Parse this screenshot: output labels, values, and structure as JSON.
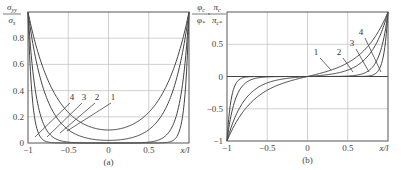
{
  "chart_data": [
    {
      "id": "a",
      "type": "line",
      "panel_label": "(a)",
      "title": "",
      "xlabel": "x/l",
      "ylabel": {
        "num": "σ",
        "num_sub": "yy",
        "den": "σ",
        "den_sub": "s"
      },
      "xlim": [
        -1,
        1
      ],
      "ylim": [
        0,
        1
      ],
      "grid": true,
      "x_ticks": [
        -1,
        -0.5,
        0,
        0.5
      ],
      "x_tick_labels": [
        "−1",
        "−0.5",
        "0",
        "0.5"
      ],
      "y_ticks": [
        0,
        0.2,
        0.4,
        0.6,
        0.8
      ],
      "y_tick_labels": [
        "0",
        "0.2",
        "0.4",
        "0.6",
        "0.8"
      ],
      "curve_labels": [
        "1",
        "2",
        "3",
        "4"
      ],
      "x": [
        -1,
        -0.95,
        -0.9,
        -0.85,
        -0.8,
        -0.7,
        -0.6,
        -0.5,
        -0.4,
        -0.3,
        -0.2,
        -0.1,
        0,
        0.1,
        0.2,
        0.3,
        0.4,
        0.5,
        0.6,
        0.7,
        0.8,
        0.85,
        0.9,
        0.95,
        1
      ],
      "series": [
        {
          "name": "1",
          "values": [
            1.0,
            0.86,
            0.74,
            0.64,
            0.55,
            0.41,
            0.31,
            0.24,
            0.18,
            0.15,
            0.12,
            0.105,
            0.1,
            0.105,
            0.12,
            0.15,
            0.18,
            0.24,
            0.31,
            0.41,
            0.55,
            0.64,
            0.74,
            0.86,
            1.0
          ]
        },
        {
          "name": "2",
          "values": [
            1.0,
            0.79,
            0.63,
            0.5,
            0.4,
            0.25,
            0.16,
            0.1,
            0.065,
            0.043,
            0.03,
            0.022,
            0.02,
            0.022,
            0.03,
            0.043,
            0.065,
            0.1,
            0.16,
            0.25,
            0.4,
            0.5,
            0.63,
            0.79,
            1.0
          ]
        },
        {
          "name": "3",
          "values": [
            1.0,
            0.61,
            0.37,
            0.22,
            0.14,
            0.05,
            0.018,
            0.007,
            0.003,
            0.001,
            0.0,
            0.0,
            0.0,
            0.0,
            0.0,
            0.001,
            0.003,
            0.007,
            0.018,
            0.05,
            0.14,
            0.22,
            0.37,
            0.61,
            1.0
          ]
        },
        {
          "name": "4",
          "values": [
            1.0,
            0.37,
            0.14,
            0.05,
            0.018,
            0.002,
            0.0,
            0.0,
            0.0,
            0.0,
            0.0,
            0.0,
            0.0,
            0.0,
            0.0,
            0.0,
            0.0,
            0.0,
            0.0,
            0.002,
            0.018,
            0.05,
            0.14,
            0.37,
            1.0
          ]
        }
      ],
      "k": [
        3.0,
        4.6,
        10,
        20
      ]
    },
    {
      "id": "b",
      "type": "line",
      "panel_label": "(b)",
      "title": "",
      "xlabel": "x/l",
      "ylabel": {
        "num": "π",
        "num_sub": "c",
        "den": "π",
        "den_sub": "c*"
      },
      "ylabel_left": {
        "num": "φ",
        "num_sub": "c",
        "den": "φ",
        "den_sub": "*"
      },
      "xlim": [
        -1,
        1
      ],
      "ylim": [
        -1,
        1
      ],
      "grid": true,
      "x_ticks": [
        -1,
        -0.5,
        0,
        0.5
      ],
      "x_tick_labels": [
        "−1",
        "−0.5",
        "0",
        "0.5"
      ],
      "y_ticks": [
        -1,
        -0.5,
        0,
        0.5
      ],
      "y_tick_labels": [
        "−1",
        "−0.5",
        "0",
        "0.5"
      ],
      "curve_labels": [
        "1",
        "2",
        "3",
        "4"
      ],
      "x": [
        -1,
        -0.95,
        -0.9,
        -0.85,
        -0.8,
        -0.7,
        -0.6,
        -0.5,
        -0.4,
        -0.3,
        -0.2,
        -0.1,
        0,
        0.1,
        0.2,
        0.3,
        0.4,
        0.5,
        0.6,
        0.7,
        0.8,
        0.85,
        0.9,
        0.95,
        1
      ],
      "series": [
        {
          "name": "1",
          "values": [
            -1.0,
            -0.86,
            -0.73,
            -0.63,
            -0.54,
            -0.4,
            -0.3,
            -0.22,
            -0.16,
            -0.11,
            -0.07,
            -0.03,
            0.0,
            0.03,
            0.07,
            0.11,
            0.16,
            0.22,
            0.3,
            0.4,
            0.54,
            0.63,
            0.73,
            0.86,
            1.0
          ]
        },
        {
          "name": "2",
          "values": [
            -1.0,
            -0.79,
            -0.63,
            -0.5,
            -0.4,
            -0.25,
            -0.16,
            -0.1,
            -0.06,
            -0.04,
            -0.02,
            -0.01,
            0.0,
            0.01,
            0.02,
            0.04,
            0.06,
            0.1,
            0.16,
            0.25,
            0.4,
            0.5,
            0.63,
            0.79,
            1.0
          ]
        },
        {
          "name": "3",
          "values": [
            -1.0,
            -0.61,
            -0.37,
            -0.22,
            -0.14,
            -0.05,
            -0.018,
            -0.007,
            -0.002,
            -0.001,
            0.0,
            0.0,
            0.0,
            0.0,
            0.0,
            0.001,
            0.002,
            0.007,
            0.018,
            0.05,
            0.14,
            0.22,
            0.37,
            0.61,
            1.0
          ]
        },
        {
          "name": "4",
          "values": [
            -1.0,
            -0.37,
            -0.14,
            -0.05,
            -0.018,
            -0.002,
            0.0,
            0.0,
            0.0,
            0.0,
            0.0,
            0.0,
            0.0,
            0.0,
            0.0,
            0.0,
            0.0,
            0.0,
            0.0,
            0.002,
            0.018,
            0.05,
            0.14,
            0.37,
            1.0
          ]
        }
      ],
      "k": [
        3.0,
        4.6,
        10,
        20
      ]
    }
  ],
  "layout": {
    "a": {
      "left": 28,
      "top": 12,
      "right": 189,
      "bottom": 143
    },
    "b": {
      "left": 227,
      "top": 12,
      "right": 388,
      "bottom": 141
    }
  },
  "annotations": {
    "a": [
      {
        "label": "4",
        "tx": 72,
        "ty": 100,
        "lx1": 70,
        "ly1": 103,
        "lx2": 35,
        "ly2": 137
      },
      {
        "label": "3",
        "tx": 84,
        "ty": 100,
        "lx1": 82,
        "ly1": 103,
        "lx2": 47,
        "ly2": 137
      },
      {
        "label": "2",
        "tx": 97,
        "ty": 100,
        "lx1": 95,
        "ly1": 103,
        "lx2": 60,
        "ly2": 133
      },
      {
        "label": "1",
        "tx": 113,
        "ty": 100,
        "lx1": 111,
        "ly1": 103,
        "lx2": 67,
        "ly2": 131
      }
    ],
    "b": [
      {
        "label": "1",
        "tx": 316,
        "ty": 55,
        "lx1": 320,
        "ly1": 58,
        "lx2": 331,
        "ly2": 70
      },
      {
        "label": "2",
        "tx": 339,
        "ty": 55,
        "lx1": 343,
        "ly1": 58,
        "lx2": 353,
        "ly2": 72
      },
      {
        "label": "3",
        "tx": 352,
        "ty": 46,
        "lx1": 356,
        "ly1": 49,
        "lx2": 369,
        "ly2": 72
      },
      {
        "label": "4",
        "tx": 361,
        "ty": 35,
        "lx1": 365,
        "ly1": 38,
        "lx2": 381,
        "ly2": 72
      }
    ]
  }
}
